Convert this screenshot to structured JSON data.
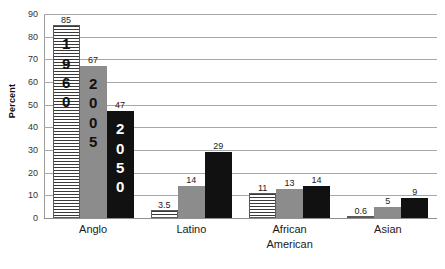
{
  "chart_data": {
    "type": "bar",
    "title": "",
    "xlabel": "",
    "ylabel": "Percent",
    "ylim": [
      0,
      90
    ],
    "ytick_step": 10,
    "yticks": [
      "90",
      "80",
      "70",
      "60",
      "50",
      "40",
      "30",
      "20",
      "10",
      "0"
    ],
    "grid": true,
    "legend_position": "none",
    "categories": [
      "Anglo",
      "Latino",
      "African American",
      "Asian"
    ],
    "category_lines": [
      [
        "Anglo"
      ],
      [
        "Latino"
      ],
      [
        "African",
        "American"
      ],
      [
        "Asian"
      ]
    ],
    "series": [
      {
        "name": "1960",
        "fill": "striped",
        "values": [
          85,
          3.5,
          11,
          0.6
        ],
        "labels": [
          "85",
          "3.5",
          "11",
          "0.6"
        ]
      },
      {
        "name": "2005",
        "fill": "gray",
        "values": [
          67,
          14,
          13,
          5
        ],
        "labels": [
          "67",
          "14",
          "13",
          "5"
        ]
      },
      {
        "name": "2050",
        "fill": "black",
        "values": [
          47,
          29,
          14,
          9
        ],
        "labels": [
          "47",
          "29",
          "14",
          "9"
        ]
      }
    ],
    "inline_bar_labels": [
      {
        "group": "Anglo",
        "series": "1960",
        "text": "1960",
        "digits": [
          "1",
          "9",
          "6",
          "0"
        ],
        "ink": "dark"
      },
      {
        "group": "Anglo",
        "series": "2005",
        "text": "2005",
        "digits": [
          "2",
          "0",
          "0",
          "5"
        ],
        "ink": "dark"
      },
      {
        "group": "Anglo",
        "series": "2050",
        "text": "2050",
        "digits": [
          "2",
          "0",
          "5",
          "0"
        ],
        "ink": "light"
      }
    ],
    "colors": {
      "series_1960_fill": "#ffffff",
      "series_1960_stripe": "#3a3a3a",
      "series_2005_fill": "#8c8c8c",
      "series_2050_fill": "#111111",
      "gridline": "#a8a8a8",
      "axis": "#9a9a9a",
      "text": "#1a1a1a",
      "background": "#ffffff"
    }
  }
}
